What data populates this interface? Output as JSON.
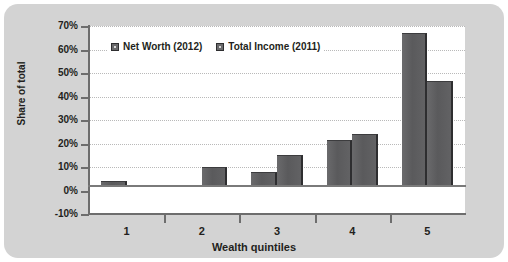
{
  "chart_data": {
    "type": "bar",
    "title": "",
    "xlabel": "Wealth quintiles",
    "ylabel": "Share of total",
    "categories": [
      "1",
      "2",
      "3",
      "4",
      "5"
    ],
    "series": [
      {
        "name": "Net Worth (2012)",
        "values": [
          4,
          2,
          8,
          21.5,
          67
        ]
      },
      {
        "name": "Total Income (2011)",
        "values": [
          0,
          10,
          15,
          24,
          46.5
        ]
      }
    ],
    "ylim": [
      -10,
      70
    ],
    "yticks": [
      70,
      60,
      50,
      40,
      30,
      20,
      10,
      0,
      -10
    ],
    "ytick_labels": [
      "70%",
      "60%",
      "50%",
      "40%",
      "30%",
      "20%",
      "10%",
      "0%",
      "-10%"
    ],
    "grid": true,
    "legend_position": "top-left-inside",
    "colors": {
      "panel_background": "#d3d3d3",
      "plot_background": "#ffffff",
      "bar_fill": "#5a5a5c",
      "bar_edge": "#2e2e30",
      "gridline": "#b9b9b9",
      "axis": "#6d6d6d",
      "text": "#231f20"
    }
  },
  "legend": {
    "items": [
      {
        "label": "Net Worth (2012)"
      },
      {
        "label": "Total Income (2011)"
      }
    ]
  },
  "axes": {
    "y_title": "Share of total",
    "x_title": "Wealth quintiles",
    "y_labels": [
      "70%",
      "60%",
      "50%",
      "40%",
      "30%",
      "20%",
      "10%",
      "0%",
      "-10%"
    ],
    "x_labels": [
      "1",
      "2",
      "3",
      "4",
      "5"
    ]
  }
}
